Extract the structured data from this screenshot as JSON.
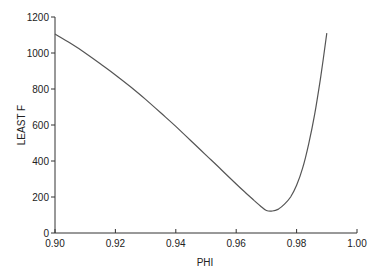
{
  "chart_data": {
    "type": "line",
    "title": "",
    "xlabel": "PHI",
    "ylabel": "LEAST F",
    "xlim": [
      0.9,
      1.0
    ],
    "ylim": [
      0,
      1200
    ],
    "xticks": [
      "0.90",
      "0.92",
      "0.94",
      "0.96",
      "0.98",
      "1.00"
    ],
    "yticks": [
      "0",
      "200",
      "400",
      "600",
      "800",
      "1000",
      "1200"
    ],
    "grid": false,
    "legend": null,
    "series": [
      {
        "name": "LEAST F",
        "color": "#555555",
        "x": [
          0.9,
          0.905,
          0.91,
          0.915,
          0.92,
          0.925,
          0.93,
          0.935,
          0.94,
          0.945,
          0.95,
          0.955,
          0.96,
          0.963,
          0.966,
          0.968,
          0.97,
          0.972,
          0.974,
          0.976,
          0.978,
          0.98,
          0.982,
          0.984,
          0.986,
          0.988,
          0.99
        ],
        "values": [
          1105,
          1055,
          1000,
          940,
          878,
          812,
          742,
          668,
          592,
          513,
          433,
          353,
          272,
          225,
          180,
          150,
          125,
          122,
          133,
          160,
          200,
          265,
          360,
          495,
          660,
          870,
          1110
        ]
      }
    ]
  }
}
